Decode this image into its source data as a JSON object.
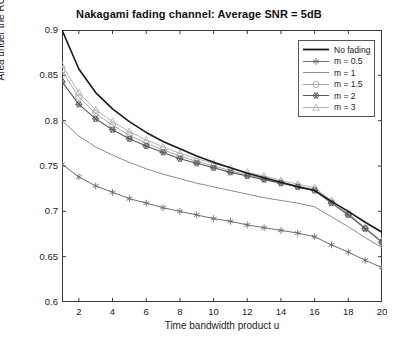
{
  "chart_data": {
    "type": "line",
    "title": "Nakagami fading channel: Average SNR = 5dB",
    "xlabel": "Time bandwidth product u",
    "ylabel": "Area under the ROC curve A",
    "ylabel_sub": "z",
    "xlim": [
      1,
      20
    ],
    "ylim": [
      0.6,
      0.9
    ],
    "grid": false,
    "legend_position": "top-right",
    "xticks": [
      2,
      4,
      6,
      8,
      10,
      12,
      14,
      16,
      18,
      20
    ],
    "xtick_labels": [
      "2",
      "4",
      "6",
      "8",
      "10",
      "12",
      "14",
      "16",
      "18",
      "20"
    ],
    "yticks": [
      0.6,
      0.65,
      0.7,
      0.75,
      0.8,
      0.85,
      0.9
    ],
    "ytick_labels": [
      "0.6",
      "0.65",
      "0.7",
      "0.75",
      "0.8",
      "0.85",
      "0.9"
    ],
    "x": [
      1,
      2,
      3,
      4,
      5,
      6,
      7,
      8,
      9,
      10,
      11,
      12,
      13,
      14,
      15,
      16,
      17,
      18,
      19,
      20
    ],
    "series": [
      {
        "name": "No fading",
        "marker": "none",
        "color": "#1a1a1a",
        "width": 1.6,
        "values": [
          0.9,
          0.857,
          0.831,
          0.813,
          0.799,
          0.787,
          0.777,
          0.769,
          0.761,
          0.754,
          0.748,
          0.742,
          0.737,
          0.732,
          0.727,
          0.723,
          0.711,
          0.7,
          0.688,
          0.677
        ]
      },
      {
        "name": "m = 0.5",
        "marker": "asterisk",
        "color": "#6e6e6e",
        "width": 1.0,
        "values": [
          0.752,
          0.738,
          0.728,
          0.721,
          0.714,
          0.709,
          0.704,
          0.7,
          0.696,
          0.692,
          0.689,
          0.685,
          0.682,
          0.679,
          0.676,
          0.672,
          0.663,
          0.655,
          0.646,
          0.638
        ]
      },
      {
        "name": "m = 1",
        "marker": "none",
        "color": "#8c8c8c",
        "width": 1.0,
        "values": [
          0.8,
          0.783,
          0.771,
          0.762,
          0.754,
          0.747,
          0.741,
          0.736,
          0.731,
          0.727,
          0.723,
          0.719,
          0.715,
          0.712,
          0.709,
          0.705,
          0.694,
          0.683,
          0.671,
          0.66
        ]
      },
      {
        "name": "m = 1.5",
        "marker": "circle",
        "color": "#a8a8a8",
        "width": 1.0,
        "values": [
          0.855,
          0.826,
          0.808,
          0.795,
          0.784,
          0.775,
          0.768,
          0.761,
          0.755,
          0.75,
          0.745,
          0.74,
          0.736,
          0.732,
          0.728,
          0.724,
          0.71,
          0.697,
          0.681,
          0.666
        ]
      },
      {
        "name": "m = 2",
        "marker": "hexagram",
        "color": "#585858",
        "width": 1.1,
        "values": [
          0.843,
          0.818,
          0.802,
          0.79,
          0.78,
          0.772,
          0.765,
          0.758,
          0.753,
          0.748,
          0.743,
          0.739,
          0.735,
          0.731,
          0.727,
          0.723,
          0.709,
          0.696,
          0.681,
          0.666
        ]
      },
      {
        "name": "m = 3",
        "marker": "triangle",
        "color": "#b4b4b4",
        "width": 1.0,
        "values": [
          0.861,
          0.831,
          0.812,
          0.799,
          0.788,
          0.779,
          0.771,
          0.764,
          0.758,
          0.753,
          0.748,
          0.743,
          0.739,
          0.734,
          0.73,
          0.726,
          0.712,
          0.698,
          0.682,
          0.667
        ]
      }
    ]
  }
}
